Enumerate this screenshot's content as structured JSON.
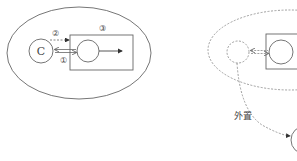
{
  "diagram": {
    "left_panel": {
      "node_c_label": "C",
      "marker_1": "①",
      "marker_2": "②",
      "marker_3": "③"
    },
    "right_panel": {
      "edge_label": "外置"
    }
  },
  "colors": {
    "stroke": "#555555",
    "background": "#ffffff"
  }
}
